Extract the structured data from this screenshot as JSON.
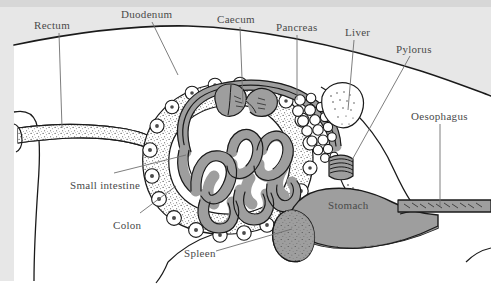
{
  "figure": {
    "background_outside_body": "#e7e7e7",
    "background_inside_body": "#ffffff",
    "ink_color": "#1a1a1a",
    "organ_fill_gray": "#9e9e9e",
    "label_color": "#4a4a4a",
    "leader_line_color": "#6f6f6f"
  },
  "labels": [
    {
      "id": "rectum",
      "text": "Rectum",
      "x": 34,
      "y": 20
    },
    {
      "id": "duodenum",
      "text": "Duodenum",
      "x": 121,
      "y": 9
    },
    {
      "id": "caecum",
      "text": "Caecum",
      "x": 217,
      "y": 14
    },
    {
      "id": "pancreas",
      "text": "Pancreas",
      "x": 276,
      "y": 22
    },
    {
      "id": "liver",
      "text": "Liver",
      "x": 345,
      "y": 27
    },
    {
      "id": "pylorus",
      "text": "Pylorus",
      "x": 396,
      "y": 44
    },
    {
      "id": "oesophagus",
      "text": "Oesophagus",
      "x": 411,
      "y": 111
    },
    {
      "id": "small-intestine",
      "text": "Small intestine",
      "x": 70,
      "y": 180
    },
    {
      "id": "colon",
      "text": "Colon",
      "x": 113,
      "y": 220
    },
    {
      "id": "spleen",
      "text": "Spleen",
      "x": 184,
      "y": 248
    },
    {
      "id": "stomach",
      "text": "Stomach",
      "x": 328,
      "y": 200
    }
  ],
  "organs": [
    {
      "id": "rectum",
      "name": "rectum"
    },
    {
      "id": "colon",
      "name": "colon"
    },
    {
      "id": "caecum",
      "name": "caecum"
    },
    {
      "id": "small-intestine",
      "name": "small-intestine"
    },
    {
      "id": "duodenum",
      "name": "duodenum"
    },
    {
      "id": "pancreas",
      "name": "pancreas"
    },
    {
      "id": "liver",
      "name": "liver"
    },
    {
      "id": "pylorus",
      "name": "pylorus"
    },
    {
      "id": "stomach",
      "name": "stomach"
    },
    {
      "id": "spleen",
      "name": "spleen"
    },
    {
      "id": "oesophagus",
      "name": "oesophagus"
    }
  ]
}
